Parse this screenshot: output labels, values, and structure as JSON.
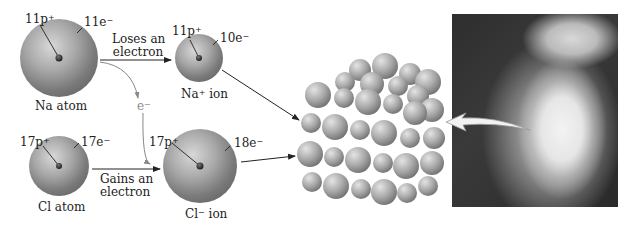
{
  "diagram": {
    "na_atom": {
      "protons": "11p",
      "electrons": "11e",
      "label_element": "Na",
      "label_suffix": " atom"
    },
    "na_ion": {
      "protons": "11p",
      "electrons": "10e",
      "label_element": "Na",
      "label_charge": "+",
      "label_suffix": " ion"
    },
    "cl_atom": {
      "protons": "17p",
      "electrons": "17e",
      "label_element": "Cl",
      "label_suffix": " atom"
    },
    "cl_ion": {
      "protons": "17p",
      "electrons": "18e",
      "label_element": "Cl",
      "label_charge": "−",
      "label_suffix": " ion"
    },
    "plus_sign": "+",
    "minus_sign": "−",
    "electron_symbol": "e",
    "arrow_loses": {
      "line1": "Loses an",
      "line2": "electron"
    },
    "arrow_gains": {
      "line1": "Gains an",
      "line2": "electron"
    },
    "lattice_label": "NaCl crystal lattice",
    "photo_label": "Table salt crystals"
  }
}
